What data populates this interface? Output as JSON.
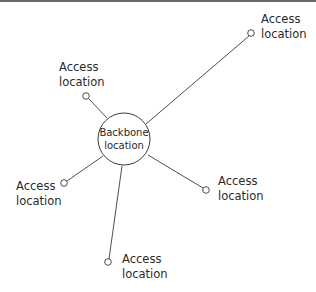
{
  "diagram": {
    "hub": {
      "line1": "Backbone",
      "line2": "location"
    },
    "nodes": [
      {
        "id": "top-right",
        "line1": "Access",
        "line2": "location"
      },
      {
        "id": "upper-left",
        "line1": "Access",
        "line2": "location"
      },
      {
        "id": "left",
        "line1": "Access",
        "line2": "location"
      },
      {
        "id": "right",
        "line1": "Access",
        "line2": "location"
      },
      {
        "id": "bottom",
        "line1": "Access",
        "line2": "location"
      }
    ],
    "colors": {
      "stroke": "#3a3a3a",
      "text": "#2a2a2a",
      "background": "#ffffff",
      "topbar": "#6a6a6a"
    }
  }
}
